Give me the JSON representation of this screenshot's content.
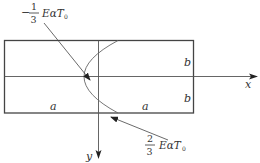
{
  "diagram": {
    "type": "plate-temperature-stress-distribution",
    "colors": {
      "stroke": "#444444",
      "text": "#333333",
      "background": "#ffffff"
    },
    "axes": {
      "x_label": "x",
      "y_label": "y"
    },
    "dimensions": {
      "half_width_left": "a",
      "half_width_right": "a",
      "half_height_top": "b",
      "half_height_bottom": "b"
    },
    "annotations": {
      "top": {
        "sign": "−",
        "numerator": "1",
        "denominator": "3",
        "expression": "EαT",
        "subscript": "0"
      },
      "bottom": {
        "sign": "",
        "numerator": "2",
        "denominator": "3",
        "expression": "EαT",
        "subscript": "0"
      }
    }
  }
}
